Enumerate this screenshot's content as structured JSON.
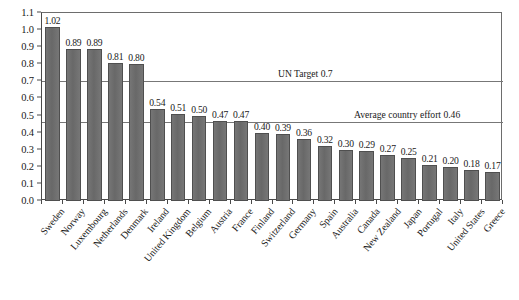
{
  "chart_data": {
    "type": "bar",
    "title": "",
    "subtitle": "",
    "xlabel": "",
    "ylabel": "",
    "ylim": [
      0.0,
      1.1
    ],
    "ytick_step": 0.1,
    "grid": "horizontal reference lines only (0.7 and 0.46)",
    "legend": "none",
    "orientation": "vertical",
    "bar_color": "#6e6e6e",
    "bar_edge_color": "#4f4f4f",
    "categories": [
      "Sweden",
      "Norway",
      "Luxembourg",
      "Netherlands",
      "Denmark",
      "Ireland",
      "United Kingdom",
      "Belgium",
      "Austria",
      "France",
      "Finland",
      "Switzerland",
      "Germany",
      "Spain",
      "Australia",
      "Canada",
      "New Zealand",
      "Japan",
      "Portugal",
      "Italy",
      "United States",
      "Greece"
    ],
    "values": [
      1.02,
      0.89,
      0.89,
      0.81,
      0.8,
      0.54,
      0.51,
      0.5,
      0.47,
      0.47,
      0.4,
      0.39,
      0.36,
      0.32,
      0.3,
      0.29,
      0.27,
      0.25,
      0.21,
      0.2,
      0.18,
      0.17
    ],
    "value_labels": [
      "1.02",
      "0.89",
      "0.89",
      "0.81",
      "0.80",
      "0.54",
      "0.51",
      "0.50",
      "0.47",
      "0.47",
      "0.40",
      "0.39",
      "0.36",
      "0.32",
      "0.30",
      "0.29",
      "0.27",
      "0.25",
      "0.21",
      "0.20",
      "0.18",
      "0.17"
    ],
    "ytick_labels": [
      "1.1",
      "1.0",
      "0.9",
      "0.8",
      "0.7",
      "0.6",
      "0.5",
      "0.4",
      "0.3",
      "0.2",
      "0.1",
      "0.0"
    ],
    "ytick_values": [
      1.1,
      1.0,
      0.9,
      0.8,
      0.7,
      0.6,
      0.5,
      0.4,
      0.3,
      0.2,
      0.1,
      0.0
    ],
    "annotations": [
      {
        "name": "un-target-line",
        "label": "UN Target 0.7",
        "value": 0.7
      },
      {
        "name": "average-country-effort-line",
        "label": "Average country effort 0.46",
        "value": 0.46
      }
    ]
  }
}
